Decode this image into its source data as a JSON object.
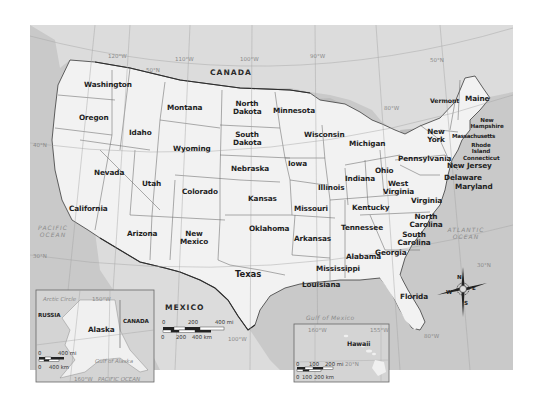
{
  "map": {
    "title": "United States",
    "colors": {
      "land_us": "#f1f1f1",
      "land_other": "#dcdcdc",
      "water": "#c8c8c8",
      "border": "#555555",
      "national_border": "#333333",
      "gridline": "#a0a0a0"
    },
    "countries": [
      {
        "id": "canada",
        "label": "CANADA"
      },
      {
        "id": "mexico",
        "label": "MEXICO"
      }
    ],
    "water_bodies": [
      {
        "id": "pacific",
        "label": "PACIFIC OCEAN"
      },
      {
        "id": "atlantic",
        "label": "ATLANTIC OCEAN"
      },
      {
        "id": "gulf",
        "label": "Gulf of Mexico"
      }
    ],
    "gridlines": {
      "longitudes": [
        "120°W",
        "110°W",
        "100°W",
        "90°W",
        "80°W",
        "100°W",
        "80°W"
      ],
      "latitudes": [
        "50°N",
        "50°N",
        "40°N",
        "30°N",
        "30°N"
      ]
    },
    "states": [
      {
        "name": "Washington"
      },
      {
        "name": "Oregon"
      },
      {
        "name": "California"
      },
      {
        "name": "Idaho"
      },
      {
        "name": "Nevada"
      },
      {
        "name": "Montana"
      },
      {
        "name": "Wyoming"
      },
      {
        "name": "Utah"
      },
      {
        "name": "Arizona"
      },
      {
        "name": "Colorado"
      },
      {
        "name": "New Mexico"
      },
      {
        "name": "North Dakota"
      },
      {
        "name": "South Dakota"
      },
      {
        "name": "Nebraska"
      },
      {
        "name": "Kansas"
      },
      {
        "name": "Oklahoma"
      },
      {
        "name": "Texas"
      },
      {
        "name": "Minnesota"
      },
      {
        "name": "Iowa"
      },
      {
        "name": "Missouri"
      },
      {
        "name": "Arkansas"
      },
      {
        "name": "Louisiana"
      },
      {
        "name": "Wisconsin"
      },
      {
        "name": "Illinois"
      },
      {
        "name": "Mississippi"
      },
      {
        "name": "Michigan"
      },
      {
        "name": "Indiana"
      },
      {
        "name": "Kentucky"
      },
      {
        "name": "Tennessee"
      },
      {
        "name": "Alabama"
      },
      {
        "name": "Ohio"
      },
      {
        "name": "Georgia"
      },
      {
        "name": "Florida"
      },
      {
        "name": "West Virginia"
      },
      {
        "name": "Virginia"
      },
      {
        "name": "North Carolina"
      },
      {
        "name": "South Carolina"
      },
      {
        "name": "Pennsylvania"
      },
      {
        "name": "New York"
      },
      {
        "name": "Vermont"
      },
      {
        "name": "Maine"
      },
      {
        "name": "New Hampshire"
      },
      {
        "name": "Massachusetts"
      },
      {
        "name": "Rhode Island"
      },
      {
        "name": "Connecticut"
      },
      {
        "name": "New Jersey"
      },
      {
        "name": "Delaware"
      },
      {
        "name": "Maryland"
      }
    ],
    "main_scale": {
      "mi_ticks": [
        "0",
        "200",
        "400 mi"
      ],
      "km_ticks": [
        "0",
        "200",
        "400 km"
      ]
    },
    "compass": {
      "n": "N",
      "s": "S",
      "e": "E",
      "w": "W"
    },
    "alaska_inset": {
      "title": "Alaska",
      "labels": {
        "russia": "RUSSIA",
        "canada": "CANADA",
        "gulf": "Gulf of Alaska",
        "pacific": "PACIFIC OCEAN",
        "arctic": "Arctic Circle",
        "lon": "150°W",
        "lon2": "160°W"
      },
      "scale": {
        "mi_ticks": [
          "0",
          "400 mi"
        ],
        "km_ticks": [
          "0",
          "400 km"
        ]
      }
    },
    "hawaii_inset": {
      "title": "Hawaii",
      "labels": {
        "lon1": "160°W",
        "lon2": "155°W",
        "lat": "20°N"
      },
      "scale": {
        "mi_ticks": [
          "0",
          "100",
          "200 mi"
        ],
        "km_ticks": [
          "0",
          "100",
          "200 km"
        ]
      }
    }
  }
}
